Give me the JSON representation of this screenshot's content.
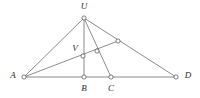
{
  "figure": {
    "background_color": "#ffffff",
    "stroke_color": "#5a5a5a",
    "label_color": "#2b2b2b",
    "node_fill_color": "#ffffff",
    "width": 200,
    "height": 98,
    "points": [
      {
        "id": "A",
        "label": "A",
        "x": 24,
        "y": 77,
        "labeled": true,
        "label_x": 13,
        "label_y": 76
      },
      {
        "id": "B",
        "label": "B",
        "x": 84,
        "y": 77,
        "labeled": true,
        "label_x": 84,
        "label_y": 89
      },
      {
        "id": "C",
        "label": "C",
        "x": 111,
        "y": 77,
        "labeled": true,
        "label_x": 111,
        "label_y": 89
      },
      {
        "id": "D",
        "label": "D",
        "x": 176,
        "y": 77,
        "labeled": true,
        "label_x": 188,
        "label_y": 76
      },
      {
        "id": "U",
        "label": "U",
        "x": 84,
        "y": 18,
        "labeled": true,
        "label_x": 84,
        "label_y": 7
      },
      {
        "id": "V",
        "label": "V",
        "x": 83,
        "y": 56,
        "labeled": true,
        "label_x": 75,
        "label_y": 49
      },
      {
        "id": "P",
        "label": "",
        "x": 97,
        "y": 51,
        "labeled": false,
        "label_x": 0,
        "label_y": 0
      },
      {
        "id": "Q",
        "label": "",
        "x": 118,
        "y": 41,
        "labeled": false,
        "label_x": 0,
        "label_y": 0
      }
    ],
    "node_radius": 2.1,
    "edges": [
      {
        "id": "edge-A-D",
        "name": "baseline-segment-A-D",
        "x1": 24,
        "y1": 77,
        "x2": 176,
        "y2": 77
      },
      {
        "id": "edge-U-A",
        "name": "segment-U-A",
        "x1": 84,
        "y1": 18,
        "x2": 24,
        "y2": 77
      },
      {
        "id": "edge-U-B",
        "name": "segment-U-B-vertical",
        "x1": 84,
        "y1": 18,
        "x2": 84,
        "y2": 77
      },
      {
        "id": "edge-U-C",
        "name": "segment-U-C",
        "x1": 84,
        "y1": 18,
        "x2": 111,
        "y2": 77
      },
      {
        "id": "edge-U-D",
        "name": "segment-U-D",
        "x1": 84,
        "y1": 18,
        "x2": 176,
        "y2": 77
      },
      {
        "id": "edge-A-Q",
        "name": "segment-A-through-V-P-to-Q",
        "x1": 24,
        "y1": 77,
        "x2": 118,
        "y2": 41
      }
    ]
  }
}
